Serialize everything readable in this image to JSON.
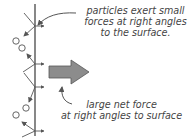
{
  "diagram": {
    "top_annotation": {
      "lines": [
        "particles exert small",
        "forces at right angles",
        "to the surface."
      ]
    },
    "bottom_annotation": {
      "lines": [
        "large net force",
        "at right angles to surface"
      ]
    },
    "colors": {
      "line": "#555555",
      "big_arrow_fill": "#8c8c8c",
      "big_arrow_stroke": "#555555",
      "text": "#444444"
    },
    "elements": {
      "surface": "vertical line",
      "particles": 4,
      "small_force_arrows": 5,
      "net_force_arrow": "large gray arrow pointing right"
    }
  }
}
